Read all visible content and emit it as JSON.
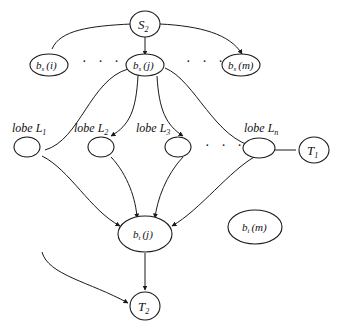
{
  "diagram": {
    "nodes": {
      "S2": {
        "base": "S",
        "sub": "2"
      },
      "bs_i": {
        "base": "b",
        "sub": "s",
        "arg": "(i)"
      },
      "bs_j": {
        "base": "b",
        "sub": "s",
        "arg": "(j)"
      },
      "bs_m": {
        "base": "b",
        "sub": "s",
        "arg": "(m)"
      },
      "L1": {
        "prefix": "lobe L",
        "sub": "1"
      },
      "L2": {
        "prefix": "lobe L",
        "sub": "2"
      },
      "L3": {
        "prefix": "lobe L",
        "sub": "3"
      },
      "Ln": {
        "prefix": "lobe L",
        "sub": "n"
      },
      "T1": {
        "base": "T",
        "sub": "1"
      },
      "bt_j": {
        "base": "b",
        "sub": "t",
        "arg": "(j)"
      },
      "bt_m": {
        "base": "b",
        "sub": "t",
        "arg": "(m)"
      },
      "T2": {
        "base": "T",
        "sub": "2"
      }
    },
    "ellipsis": "· · ·",
    "edges": [
      {
        "from": "S2",
        "to": "bs_i",
        "arrow": false
      },
      {
        "from": "S2",
        "to": "bs_j",
        "arrow": true
      },
      {
        "from": "S2",
        "to": "bs_m",
        "arrow": true
      },
      {
        "from": "bs_j",
        "to": "L1",
        "arrow": false
      },
      {
        "from": "bs_j",
        "to": "L2",
        "arrow": true
      },
      {
        "from": "bs_j",
        "to": "L3",
        "arrow": true
      },
      {
        "from": "bs_j",
        "to": "Ln",
        "arrow": false
      },
      {
        "from": "Ln",
        "to": "T1",
        "arrow": false
      },
      {
        "from": "L1",
        "to": "bt_j",
        "arrow": true
      },
      {
        "from": "L2",
        "to": "bt_j",
        "arrow": true
      },
      {
        "from": "L3",
        "to": "bt_j",
        "arrow": true
      },
      {
        "from": "Ln",
        "to": "bt_j",
        "arrow": true
      },
      {
        "from": "bt_j",
        "to": "T2",
        "arrow": true
      },
      {
        "from": "offscreen-left",
        "to": "T2",
        "arrow": true
      }
    ]
  }
}
